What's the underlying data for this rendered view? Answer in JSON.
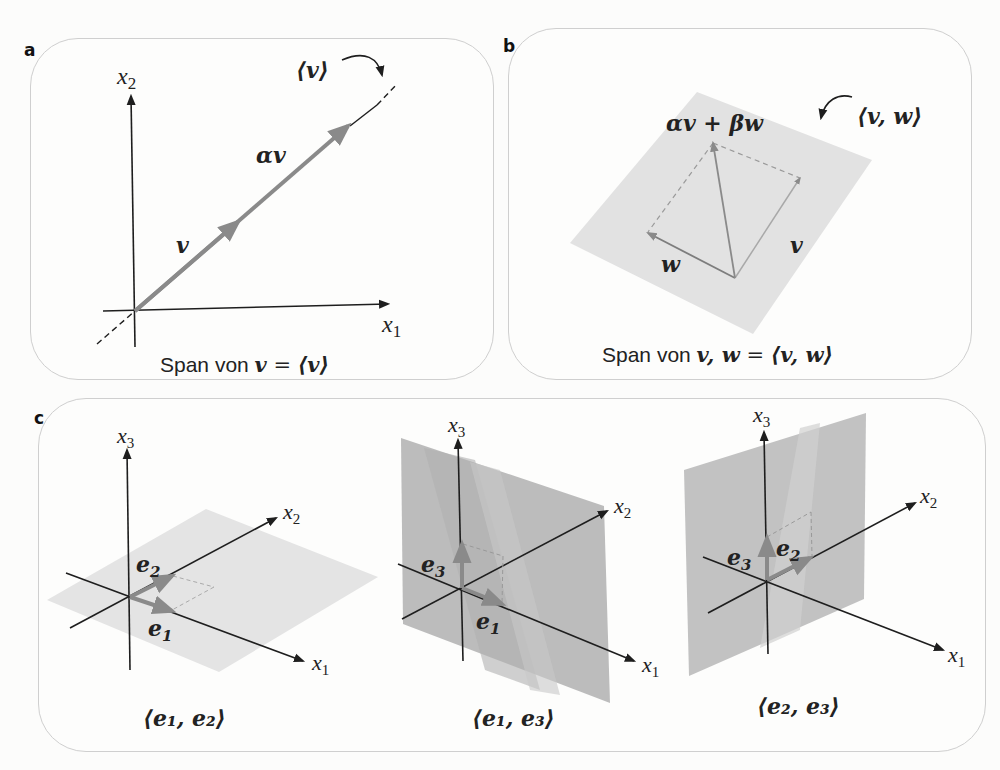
{
  "panels": {
    "a": {
      "letter": "a",
      "axis_x": "x",
      "axis_x_sub": "1",
      "axis_y": "x",
      "axis_y_sub": "2",
      "vector_label": "v",
      "scaled_label": "αv",
      "span_label": "⟨v⟩",
      "caption_text": "Span von ",
      "caption_math": "v",
      "caption_eq": " = ",
      "caption_span": "⟨v⟩"
    },
    "b": {
      "letter": "b",
      "combo_label": "αv + βw",
      "span_label": "⟨v, w⟩",
      "v_label": "v",
      "w_label": "w",
      "caption_text": "Span von ",
      "caption_math": "v, w",
      "caption_eq": " = ",
      "caption_span": "⟨v, w⟩"
    },
    "c": {
      "letter": "c",
      "subfigures": [
        {
          "x1": "x",
          "x1_sub": "1",
          "x2": "x",
          "x2_sub": "2",
          "x3": "x",
          "x3_sub": "3",
          "basis_a": "e",
          "basis_a_sub": "2",
          "basis_b": "e",
          "basis_b_sub": "1",
          "caption": "⟨e₁, e₂⟩"
        },
        {
          "x1": "x",
          "x1_sub": "1",
          "x2": "x",
          "x2_sub": "2",
          "x3": "x",
          "x3_sub": "3",
          "basis_a": "e",
          "basis_a_sub": "3",
          "basis_b": "e",
          "basis_b_sub": "1",
          "caption": "⟨e₁, e₃⟩"
        },
        {
          "x1": "x",
          "x1_sub": "1",
          "x2": "x",
          "x2_sub": "2",
          "x3": "x",
          "x3_sub": "3",
          "basis_a": "e",
          "basis_a_sub": "3",
          "basis_b": "e",
          "basis_b_sub": "2",
          "caption": "⟨e₂, e₃⟩"
        }
      ]
    }
  },
  "colors": {
    "axis": "#1e1e1e",
    "vector": "#8a8a8a",
    "plane_light": "#e3e3e3",
    "plane_dark": "#bdbdbd",
    "panel_border": "#cfcfcf"
  }
}
